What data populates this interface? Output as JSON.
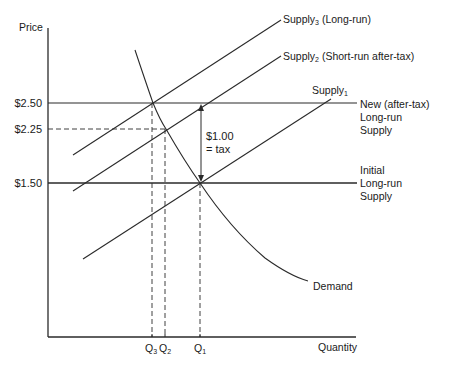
{
  "diagram": {
    "axes": {
      "y_label": "Price",
      "x_label": "Quantity"
    },
    "price_levels": [
      {
        "label": "$2.50",
        "style": "solid",
        "description": "New (after-tax) Long-run Supply"
      },
      {
        "label": "$2.25",
        "style": "dashed"
      },
      {
        "label": "$1.50",
        "style": "solid",
        "description": "Initial Long-run Supply"
      }
    ],
    "quantity_levels": [
      {
        "label": "Q",
        "sub": "3"
      },
      {
        "label": "Q",
        "sub": "2"
      },
      {
        "label": "Q",
        "sub": "1"
      }
    ],
    "curves": {
      "supply3": {
        "name": "Supply",
        "sub": "3",
        "note": " (Long-run)"
      },
      "supply2": {
        "name": "Supply",
        "sub": "2",
        "note": " (Short-run after-tax)"
      },
      "supply1": {
        "name": "Supply",
        "sub": "1",
        "note": ""
      },
      "demand": {
        "name": "Demand"
      }
    },
    "horizontal_labels": {
      "new_lr_supply": [
        "New (after-tax)",
        "Long-run",
        "Supply"
      ],
      "initial_lr_supply": [
        "Initial",
        "Long-run",
        "Supply"
      ]
    },
    "tax_annotation": {
      "line1": "$1.00",
      "line2": "= tax"
    },
    "colors": {
      "line": "#2a2a2a",
      "background": "#ffffff"
    }
  }
}
